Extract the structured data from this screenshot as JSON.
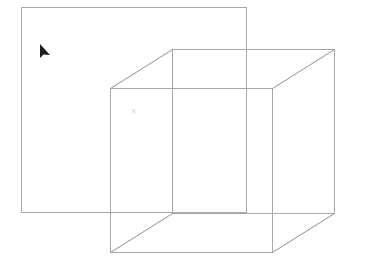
{
  "canvas": {
    "width": 366,
    "height": 268,
    "background": "#ffffff"
  },
  "colors": {
    "line": "#a8a8a8",
    "diagonal": "#909090",
    "cursor": "#1e1e1e",
    "marker": "#d8d8d8"
  },
  "shapes": {
    "rectangle": {
      "x": 21,
      "y": 7,
      "width": 225,
      "height": 205
    },
    "cube": {
      "front": {
        "x": 110,
        "y": 88,
        "width": 162,
        "height": 164
      },
      "back": {
        "x": 172,
        "y": 49,
        "width": 162,
        "height": 164
      }
    },
    "marker": {
      "x": 134,
      "y": 110,
      "symbol": "×"
    }
  },
  "cursor": {
    "x": 40,
    "y": 44,
    "icon": "arrow-pointer"
  }
}
